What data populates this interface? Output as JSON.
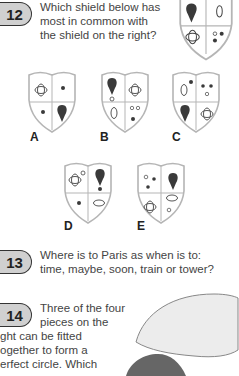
{
  "questions": [
    {
      "number": "12",
      "text_lines": [
        "Which shield below has",
        "most in common with",
        "the shield on the right?"
      ],
      "options": [
        "A",
        "B",
        "C",
        "D",
        "E"
      ]
    },
    {
      "number": "13",
      "text_lines": [
        "Where is to Paris as when is to:",
        "time, maybe, soon, train or tower?"
      ]
    },
    {
      "number": "14",
      "text_lines": [
        "Three of the four",
        "pieces on the",
        "ght can be fitted",
        "ogether to form a",
        "erfect circle. Which"
      ]
    }
  ],
  "colors": {
    "badge_fill": "#d0d0d0",
    "shape_dark": "#3a3a3a",
    "shield_stroke": "#b5b5b5",
    "piece_light": "#ececec",
    "piece_dark": "#666666"
  }
}
